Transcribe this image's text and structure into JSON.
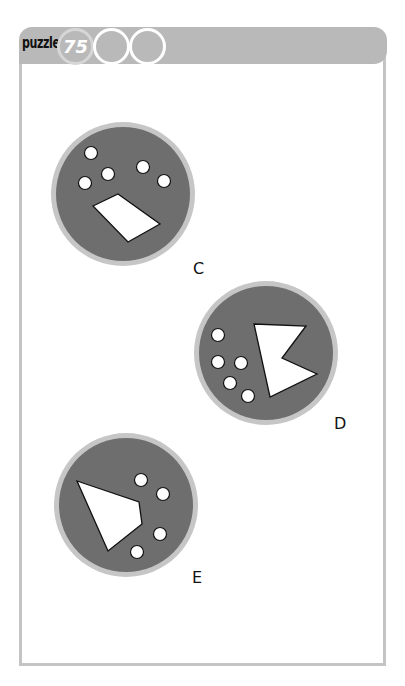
{
  "header": {
    "label": "puzzle",
    "number": "75",
    "empty_circles": 2
  },
  "colors": {
    "header_bar": "#b9b9b9",
    "frame_border": "#c4c4c4",
    "circle_ring": "#c6c6c6",
    "circle_fill": "#6e6e6e",
    "shape_fill": "#ffffff",
    "shape_stroke": "#111111"
  },
  "options": [
    {
      "label": "C",
      "circle": {
        "cx": 123,
        "cy": 194,
        "r": 72
      },
      "dots": [
        [
          91,
          153
        ],
        [
          108,
          174
        ],
        [
          85,
          183
        ],
        [
          143,
          167
        ],
        [
          164,
          181
        ]
      ],
      "shape": [
        [
          93,
          206
        ],
        [
          118,
          194
        ],
        [
          160,
          224
        ],
        [
          128,
          242
        ]
      ],
      "label_pos": {
        "x": 193,
        "y": 259
      }
    },
    {
      "label": "D",
      "circle": {
        "cx": 266,
        "cy": 353,
        "r": 72
      },
      "dots": [
        [
          218,
          335
        ],
        [
          218,
          362
        ],
        [
          241,
          363
        ],
        [
          230,
          383
        ],
        [
          248,
          396
        ]
      ],
      "shape": [
        [
          254,
          324
        ],
        [
          306,
          326
        ],
        [
          282,
          358
        ],
        [
          317,
          374
        ],
        [
          270,
          397
        ]
      ],
      "label_pos": {
        "x": 334,
        "y": 414
      }
    },
    {
      "label": "E",
      "circle": {
        "cx": 126,
        "cy": 505,
        "r": 72
      },
      "dots": [
        [
          141,
          480
        ],
        [
          163,
          494
        ],
        [
          160,
          534
        ],
        [
          137,
          552
        ]
      ],
      "shape": [
        [
          77,
          481
        ],
        [
          139,
          502
        ],
        [
          142,
          524
        ],
        [
          108,
          551
        ]
      ],
      "label_pos": {
        "x": 192,
        "y": 568
      }
    }
  ]
}
